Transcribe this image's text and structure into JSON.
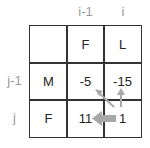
{
  "column_headers": [
    "i-1",
    "i"
  ],
  "row_headers": [
    "j-1",
    "j"
  ],
  "cells": {
    "r0c0": "",
    "r0c1": "F",
    "r0c2": "L",
    "r1c0": "M",
    "r1c1": "-5",
    "r1c2": "-15",
    "r2c0": "F",
    "r2c1": "11",
    "r2c2": "1"
  },
  "arrows": [
    {
      "from": "r2c2",
      "to": "r1c1",
      "direction": "diagonal",
      "weight": "thin"
    },
    {
      "from": "r2c2",
      "to": "r1c2",
      "direction": "up",
      "weight": "thin"
    },
    {
      "from": "r2c2",
      "to": "r2c1",
      "direction": "left",
      "weight": "thick"
    }
  ],
  "colors": {
    "grid": "#333333",
    "header": "#9a9a9a",
    "arrow": "#a8a8a8"
  }
}
